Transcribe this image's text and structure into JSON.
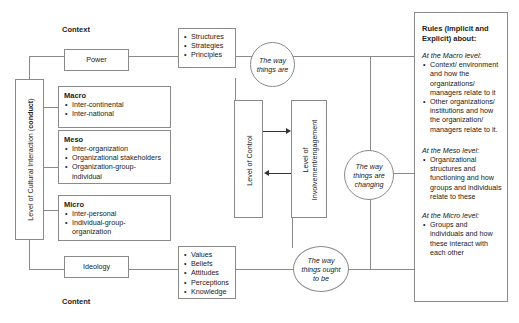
{
  "labels": {
    "context": "Context",
    "content": "Content"
  },
  "left_axis": {
    "prefix": "Level of Cultural Interaction (",
    "bold": "conduct",
    "suffix": ")"
  },
  "power": {
    "label": "Power"
  },
  "ideology": {
    "label": "Ideology"
  },
  "power_items": [
    "Structures",
    "Strategies",
    "Principles"
  ],
  "ideology_items": [
    "Values",
    "Beliefs",
    "Attitudes",
    "Perceptions",
    "Knowledge"
  ],
  "levels": {
    "macro": {
      "title": "Macro",
      "items": [
        "Inter-continental",
        "Inter-national"
      ]
    },
    "meso": {
      "title": "Meso",
      "items": [
        "Inter-organization",
        "Organizational stakeholders",
        "Organization-group-individual"
      ]
    },
    "micro": {
      "title": "Micro",
      "items": [
        "Inter-personal",
        "Individual-group-organization"
      ]
    }
  },
  "circles": {
    "are": "The way things are",
    "changing": "The way things are changing",
    "ought": "The way things ought to be"
  },
  "control": {
    "label": "Level of Control"
  },
  "involvement": {
    "line1": "Level of",
    "line2": "Involvement/engagement"
  },
  "rules": {
    "title": "Rules (Implicit and Explicit) about:",
    "macro_heading": "At the Macro level:",
    "macro_items": [
      "Context/ environment and how the organizations/ managers relate to it",
      "Other organizations/ institutions and how the organization/ managers relate to it."
    ],
    "meso_heading": "At the Meso level:",
    "meso_items": [
      "Organizational structures and functioning and how groups and individuals relate to these"
    ],
    "micro_heading": "At the Micro level:",
    "micro_items": [
      "Groups and individuals and how these interact with each other"
    ]
  },
  "colors": {
    "line": "#8a8a8a",
    "text": "#222222",
    "arrow": "#333333"
  }
}
